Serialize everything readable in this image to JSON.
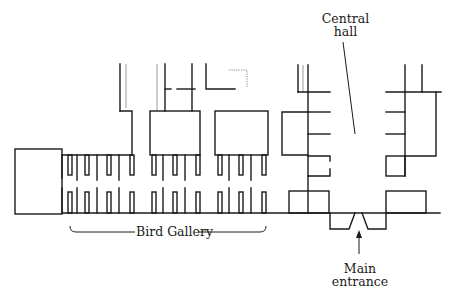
{
  "diagram": {
    "type": "floor-plan",
    "labels": {
      "central_hall_line1": "Central",
      "central_hall_line2": "hall",
      "bird_gallery": "Bird Gallery",
      "main_entrance_line1": "Main",
      "main_entrance_line2": "entrance"
    },
    "colors": {
      "wall": "#1a1a1a",
      "background": "#ffffff"
    }
  }
}
